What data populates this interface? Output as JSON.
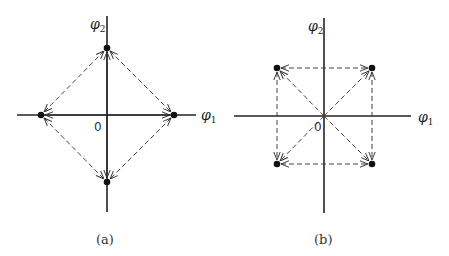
{
  "figure": {
    "panels": [
      {
        "id": "a",
        "caption": "(a)",
        "axis_x_label": "φ",
        "axis_x_sub": "1",
        "axis_y_label": "φ",
        "axis_y_sub": "2",
        "origin_label": "0",
        "points": [
          [
            107,
            48
          ],
          [
            41,
            115
          ],
          [
            174,
            115
          ],
          [
            107,
            182
          ]
        ]
      },
      {
        "id": "b",
        "caption": "(b)",
        "axis_x_label": "φ",
        "axis_x_sub": "1",
        "axis_y_label": "φ",
        "axis_y_sub": "2",
        "origin_label": "0",
        "points": [
          [
            277,
            68
          ],
          [
            372,
            68
          ],
          [
            277,
            164
          ],
          [
            372,
            164
          ]
        ]
      }
    ]
  }
}
